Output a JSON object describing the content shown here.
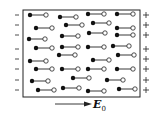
{
  "figure": {
    "left_charge_symbol": "−",
    "right_charge_symbol": "+",
    "field_label": "E",
    "field_subscript": "0",
    "colors": {
      "stroke": "#222222",
      "background": "#ffffff",
      "positive_end": "#ffffff",
      "negative_end": "#111111"
    },
    "box": {
      "x": 23,
      "y": 10,
      "w": 117,
      "h": 87
    },
    "charge_rows_y": [
      15,
      25,
      35,
      49,
      59,
      69,
      80,
      90
    ],
    "dipoles": [
      [
        30,
        15
      ],
      [
        60,
        17
      ],
      [
        88,
        14
      ],
      [
        117,
        14
      ],
      [
        36,
        28
      ],
      [
        66,
        25
      ],
      [
        93,
        23
      ],
      [
        117,
        28
      ],
      [
        29,
        39
      ],
      [
        62,
        36
      ],
      [
        89,
        33
      ],
      [
        117,
        35
      ],
      [
        36,
        48
      ],
      [
        62,
        47
      ],
      [
        88,
        47
      ],
      [
        113,
        46
      ],
      [
        30,
        61
      ],
      [
        59,
        55
      ],
      [
        93,
        60
      ],
      [
        118,
        55
      ],
      [
        36,
        69
      ],
      [
        62,
        69
      ],
      [
        88,
        69
      ],
      [
        117,
        69
      ],
      [
        32,
        81
      ],
      [
        73,
        78
      ],
      [
        107,
        80
      ],
      [
        38,
        90
      ],
      [
        63,
        88
      ],
      [
        88,
        91
      ],
      [
        119,
        89
      ]
    ]
  }
}
